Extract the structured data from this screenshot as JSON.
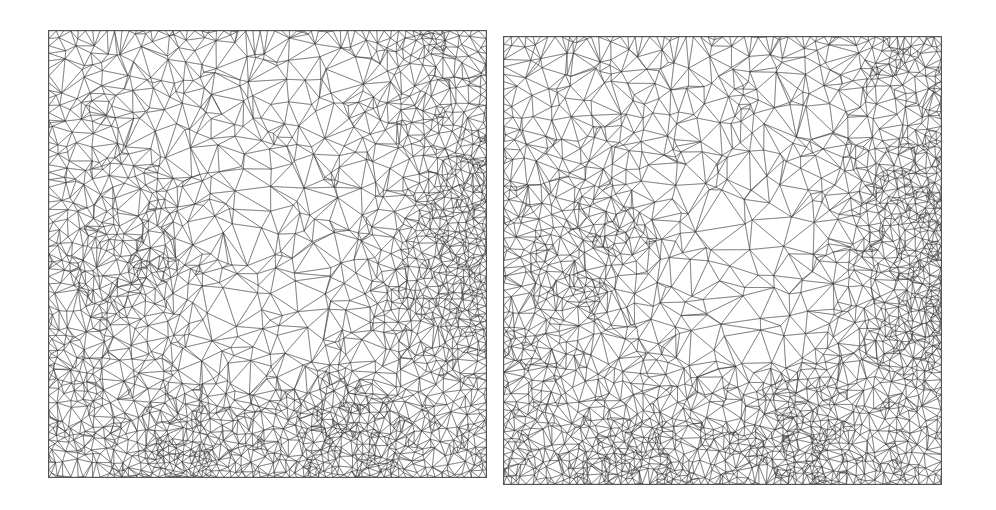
{
  "figure": {
    "type": "side-by-side triangular mesh comparison",
    "panels": [
      {
        "id": "left",
        "description": "Unstructured triangular mesh, coarse in center, refined near left-middle, right edge and bottom edge",
        "refinement_zones": [
          {
            "cx": 0.19,
            "cy": 0.5,
            "r": 0.1,
            "strength": 0.6
          },
          {
            "cx": 0.99,
            "cy": 0.35,
            "r": 0.1,
            "strength": 1.0
          },
          {
            "cx": 0.99,
            "cy": 0.6,
            "r": 0.12,
            "strength": 1.0
          },
          {
            "cx": 0.3,
            "cy": 0.99,
            "r": 0.1,
            "strength": 1.0
          },
          {
            "cx": 0.68,
            "cy": 0.99,
            "r": 0.1,
            "strength": 1.0
          },
          {
            "cx": 0.67,
            "cy": 0.86,
            "r": 0.06,
            "strength": 0.7
          },
          {
            "cx": 0.86,
            "cy": 0.02,
            "r": 0.05,
            "strength": 0.6
          },
          {
            "cx": 0.0,
            "cy": 0.75,
            "r": 0.08,
            "strength": 0.5
          }
        ],
        "coarse_center": {
          "cx": 0.55,
          "cy": 0.52
        }
      },
      {
        "id": "right",
        "description": "Unstructured triangular mesh with similar refinement pattern, slightly different node distribution",
        "refinement_zones": [
          {
            "cx": 0.19,
            "cy": 0.5,
            "r": 0.1,
            "strength": 0.6
          },
          {
            "cx": 0.99,
            "cy": 0.35,
            "r": 0.1,
            "strength": 1.0
          },
          {
            "cx": 0.99,
            "cy": 0.6,
            "r": 0.12,
            "strength": 1.0
          },
          {
            "cx": 0.3,
            "cy": 0.99,
            "r": 0.1,
            "strength": 1.0
          },
          {
            "cx": 0.68,
            "cy": 0.99,
            "r": 0.1,
            "strength": 1.0
          },
          {
            "cx": 0.67,
            "cy": 0.86,
            "r": 0.06,
            "strength": 0.7
          },
          {
            "cx": 0.86,
            "cy": 0.02,
            "r": 0.05,
            "strength": 0.6
          },
          {
            "cx": 0.0,
            "cy": 0.75,
            "r": 0.08,
            "strength": 0.5
          }
        ],
        "coarse_center": {
          "cx": 0.55,
          "cy": 0.5
        }
      }
    ],
    "colors": {
      "line": "#3a3a3a",
      "background": "#ffffff",
      "frame": "#555555"
    }
  }
}
